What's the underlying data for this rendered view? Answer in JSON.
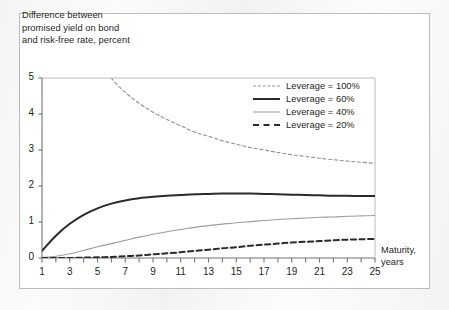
{
  "figure": {
    "title_lines": [
      "Difference between",
      "promised yield on bond",
      "and risk-free rate, percent"
    ],
    "x_axis_title_lines": [
      "Maturity,",
      "years"
    ],
    "frame_color": "#b9bcbe",
    "axis_color": "#6f7477",
    "text_color": "#231f20"
  },
  "legend": {
    "items": [
      {
        "label": "Leverage = 100%",
        "style": "dashed-light",
        "color": "#8c9093"
      },
      {
        "label": "Leverage = 60%",
        "style": "solid-bold",
        "color": "#2a2a2a"
      },
      {
        "label": "Leverage = 40%",
        "style": "solid-thin",
        "color": "#9a9ea1"
      },
      {
        "label": "Leverage = 20%",
        "style": "dashed-bold",
        "color": "#2a2a2a"
      }
    ]
  },
  "chart_data": {
    "type": "line",
    "title": "Difference between promised yield on bond and risk-free rate, percent",
    "subtitle": "",
    "xlabel": "Maturity, years",
    "ylabel": "Difference between promised yield on bond and risk-free rate, percent",
    "xlim": [
      1,
      25
    ],
    "ylim": [
      0,
      5
    ],
    "xticks": [
      1,
      2,
      3,
      4,
      5,
      6,
      7,
      8,
      9,
      10,
      11,
      12,
      13,
      14,
      15,
      16,
      17,
      18,
      19,
      20,
      21,
      22,
      23,
      24,
      25
    ],
    "xticklabels": [
      "1",
      "",
      "3",
      "",
      "5",
      "",
      "7",
      "",
      "9",
      "",
      "11",
      "",
      "13",
      "",
      "15",
      "",
      "17",
      "",
      "19",
      "",
      "21",
      "",
      "23",
      "",
      "25"
    ],
    "yticks": [
      0,
      1,
      2,
      3,
      4,
      5
    ],
    "yticklabels": [
      "0",
      "1",
      "2",
      "3",
      "4",
      "5"
    ],
    "grid": false,
    "legend_position": "upper right",
    "x": [
      1,
      2,
      3,
      4,
      5,
      6,
      7,
      8,
      9,
      10,
      11,
      12,
      13,
      14,
      15,
      16,
      17,
      18,
      19,
      20,
      21,
      22,
      23,
      24,
      25
    ],
    "series": [
      {
        "name": "Leverage = 100%",
        "style": "dashed-light",
        "color": "#8c9093",
        "note": "Declines steeply; exceeds plot top (5) for maturities below about 6 years, crossing y=5 near x=6.",
        "values": [
          14.2,
          9.6,
          7.6,
          6.4,
          5.6,
          5.0,
          4.6,
          4.3,
          4.05,
          3.85,
          3.67,
          3.5,
          3.38,
          3.26,
          3.16,
          3.07,
          3.0,
          2.93,
          2.87,
          2.82,
          2.77,
          2.73,
          2.69,
          2.66,
          2.63
        ]
      },
      {
        "name": "Leverage = 60%",
        "style": "solid-bold",
        "color": "#2a2a2a",
        "note": "Rises quickly from near zero, peaks about 1.79 near 14-16 years, then flattens slightly to about 1.72.",
        "values": [
          0.2,
          0.62,
          0.95,
          1.2,
          1.38,
          1.51,
          1.6,
          1.66,
          1.7,
          1.73,
          1.75,
          1.77,
          1.78,
          1.79,
          1.79,
          1.79,
          1.78,
          1.77,
          1.76,
          1.75,
          1.74,
          1.73,
          1.73,
          1.72,
          1.72
        ]
      },
      {
        "name": "Leverage = 40%",
        "style": "solid-thin",
        "color": "#9a9ea1",
        "note": "Rises steadily from zero toward about 1.18 at 25 years.",
        "values": [
          0.01,
          0.05,
          0.12,
          0.21,
          0.31,
          0.4,
          0.49,
          0.58,
          0.66,
          0.73,
          0.79,
          0.85,
          0.9,
          0.94,
          0.98,
          1.01,
          1.04,
          1.07,
          1.09,
          1.11,
          1.13,
          1.14,
          1.16,
          1.17,
          1.18
        ]
      },
      {
        "name": "Leverage = 20%",
        "style": "dashed-bold",
        "color": "#2a2a2a",
        "note": "Stays near zero for short maturities, then rises slowly to about 0.53 at 25 years.",
        "values": [
          0.0,
          0.0,
          0.0,
          0.01,
          0.02,
          0.03,
          0.05,
          0.07,
          0.1,
          0.13,
          0.16,
          0.2,
          0.23,
          0.27,
          0.3,
          0.34,
          0.37,
          0.4,
          0.43,
          0.45,
          0.47,
          0.49,
          0.51,
          0.52,
          0.53
        ]
      }
    ]
  }
}
